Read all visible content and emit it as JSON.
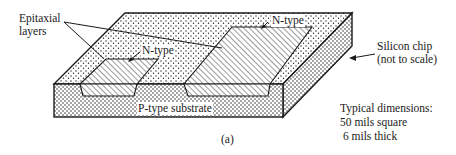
{
  "figure": {
    "caption": "(a)",
    "labels": {
      "epitaxial": [
        "Epitaxial",
        "layers"
      ],
      "n_type_left": "N-type",
      "n_type_right": "N-type",
      "p_substrate": "P-type substrate",
      "silicon_chip": [
        "Silicon chip",
        "(not to scale)"
      ],
      "dimensions": [
        "Typical dimensions:",
        "50 mils square",
        " 6 mils thick"
      ]
    },
    "colors": {
      "line": "#1a1a1a",
      "background": "#ffffff"
    }
  }
}
